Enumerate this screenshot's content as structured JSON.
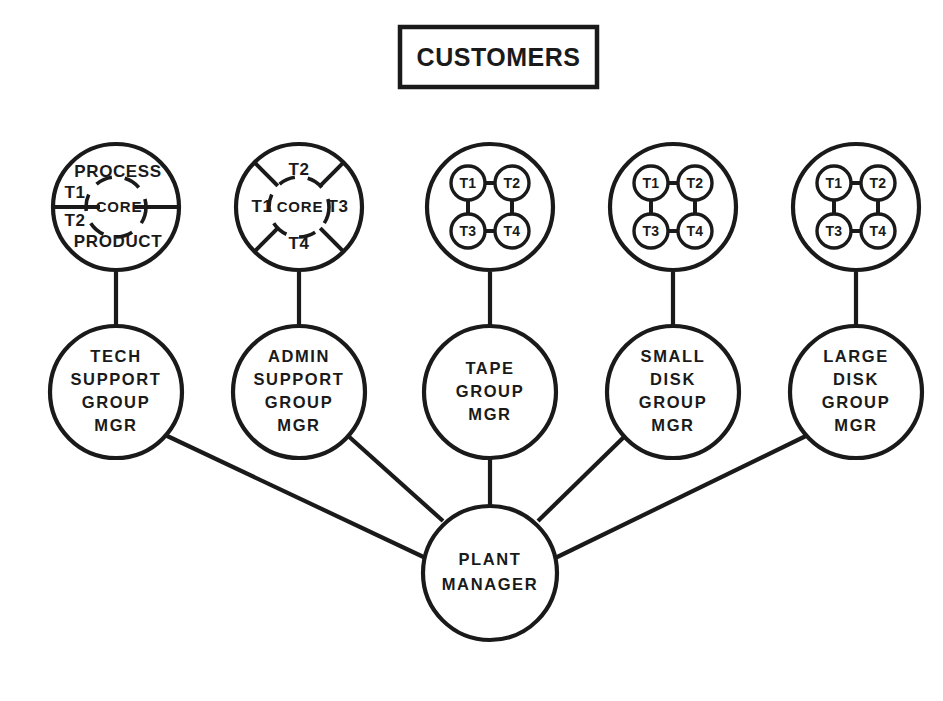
{
  "title": {
    "label": "CUSTOMERS"
  },
  "colors": {
    "ink": "#1a1a1a",
    "paper": "#ffffff"
  },
  "top_nodes": [
    {
      "id": "tech-support-model",
      "kind": "process-product-core",
      "center_label": "CORE",
      "top_label": "PROCESS",
      "bottom_label": "PRODUCT",
      "left_upper_label": "T1",
      "left_lower_label": "T2"
    },
    {
      "id": "admin-support-model",
      "kind": "four-sector-core",
      "center_label": "CORE",
      "top_label": "T2",
      "left_label": "T1",
      "right_label": "T3",
      "bottom_label": "T4"
    },
    {
      "id": "tape-group-network",
      "kind": "square-network",
      "nodes": [
        "T1",
        "T2",
        "T3",
        "T4"
      ]
    },
    {
      "id": "small-disk-group-network",
      "kind": "square-network",
      "nodes": [
        "T1",
        "T2",
        "T3",
        "T4"
      ]
    },
    {
      "id": "large-disk-group-network",
      "kind": "square-network",
      "nodes": [
        "T1",
        "T2",
        "T3",
        "T4"
      ]
    }
  ],
  "managers": [
    {
      "id": "tech-support-group-mgr",
      "lines": [
        "TECH",
        "SUPPORT",
        "GROUP",
        "MGR"
      ]
    },
    {
      "id": "admin-support-group-mgr",
      "lines": [
        "ADMIN",
        "SUPPORT",
        "GROUP",
        "MGR"
      ]
    },
    {
      "id": "tape-group-mgr",
      "lines": [
        "TAPE",
        "GROUP",
        "MGR"
      ]
    },
    {
      "id": "small-disk-group-mgr",
      "lines": [
        "SMALL",
        "DISK",
        "GROUP",
        "MGR"
      ]
    },
    {
      "id": "large-disk-group-mgr",
      "lines": [
        "LARGE",
        "DISK",
        "GROUP",
        "MGR"
      ]
    }
  ],
  "root": {
    "id": "plant-manager",
    "lines": [
      "PLANT",
      "MANAGER"
    ]
  }
}
